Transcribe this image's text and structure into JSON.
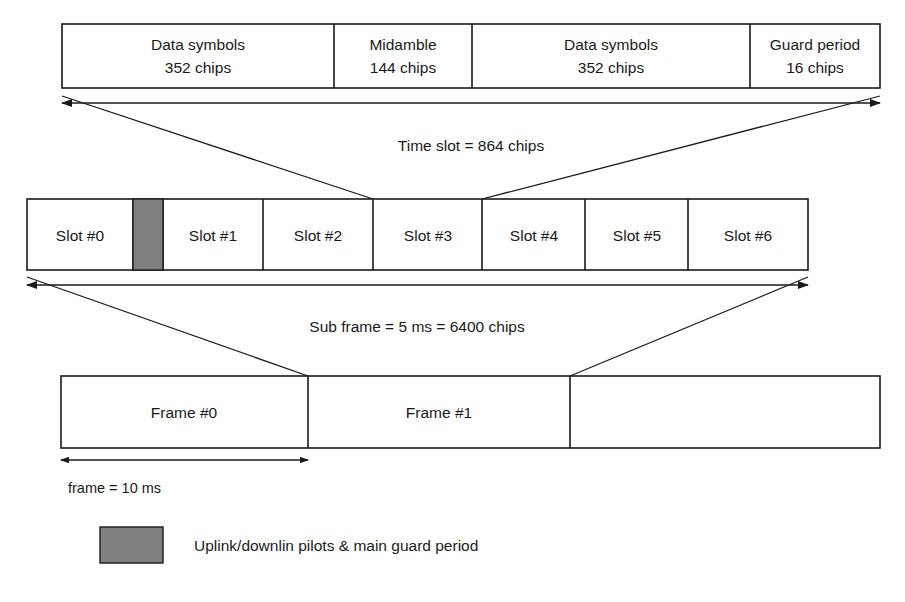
{
  "figure": {
    "colors": {
      "line": "#1a1a1a",
      "fill": "#ffffff",
      "highlight": "#808080",
      "background": "#ffffff"
    }
  },
  "burst_row": {
    "name": "time-slot-burst-structure",
    "cells": [
      {
        "line1": "Data symbols",
        "line2": "352 chips",
        "x": 62,
        "width": 272
      },
      {
        "line1": "Midamble",
        "line2": "144 chips",
        "x": 334,
        "width": 138
      },
      {
        "line1": "Data symbols",
        "line2": "352 chips",
        "x": 472,
        "width": 278
      },
      {
        "line1": "Guard period",
        "line2": "16 chips",
        "x": 750,
        "width": 130
      }
    ],
    "y": 24,
    "height": 64
  },
  "time_slot_dimension": {
    "label": "Time slot = 864 chips",
    "x1": 62,
    "x2": 880,
    "y": 103,
    "label_x": 471,
    "label_y": 146
  },
  "slot_row": {
    "name": "sub-frame-slot-structure",
    "y": 199,
    "height": 71,
    "cells": [
      {
        "label": "Slot #0",
        "x": 27,
        "width": 106
      },
      {
        "label": "Slot #1",
        "x": 163,
        "width": 100
      },
      {
        "label": "Slot #2",
        "x": 263,
        "width": 110
      },
      {
        "label": "Slot #3",
        "x": 373,
        "width": 109
      },
      {
        "label": "Slot #4",
        "x": 482,
        "width": 103
      },
      {
        "label": "Slot #5",
        "x": 585,
        "width": 103
      },
      {
        "label": "Slot  #6",
        "x": 688,
        "width": 120
      }
    ],
    "highlight_block": {
      "name": "uplink-downlink-pilot-block",
      "x": 133,
      "width": 30,
      "color": "#808080"
    }
  },
  "sub_frame_dimension": {
    "label": "Sub frame = 5 ms = 6400 chips",
    "x1": 27,
    "x2": 808,
    "y": 285,
    "label_x": 417,
    "label_y": 327
  },
  "frame_row": {
    "name": "frame-structure",
    "y": 376,
    "height": 72,
    "cells": [
      {
        "label": "Frame #0",
        "x": 61,
        "width": 247
      },
      {
        "label": "Frame #1",
        "x": 308,
        "width": 262
      },
      {
        "label": "",
        "x": 570,
        "width": 310
      }
    ]
  },
  "frame_dimension": {
    "label": "frame = 10 ms",
    "x1": 61,
    "x2": 308,
    "y": 460,
    "label_x": 125,
    "label_y": 488
  },
  "legend": {
    "name": "legend",
    "swatch": {
      "x": 100,
      "y": 527,
      "width": 63,
      "height": 36,
      "color": "#808080"
    },
    "label": "Uplink/downlin pilots & main guard period",
    "label_x": 194,
    "label_y": 551
  },
  "leaders": {
    "time_slot_to_slot3": [
      {
        "x1": 62,
        "y1": 96,
        "x2": 373,
        "y2": 199
      },
      {
        "x1": 880,
        "y1": 96,
        "x2": 482,
        "y2": 199
      }
    ],
    "sub_frame_to_frame": [
      {
        "x1": 27,
        "y1": 277,
        "x2": 308,
        "y2": 376
      },
      {
        "x1": 808,
        "y1": 277,
        "x2": 570,
        "y2": 376
      }
    ]
  }
}
